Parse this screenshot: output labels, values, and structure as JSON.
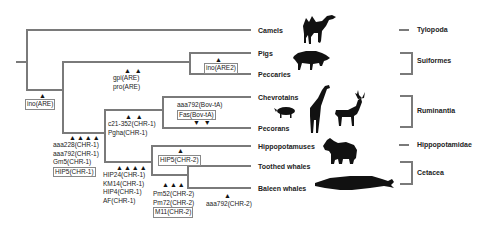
{
  "taxa": [
    {
      "name": "Camels",
      "y": 30
    },
    {
      "name": "Pigs",
      "y": 53
    },
    {
      "name": "Peccaries",
      "y": 74
    },
    {
      "name": "Chevrotains",
      "y": 97
    },
    {
      "name": "Pecorans",
      "y": 128
    },
    {
      "name": "Hippopotamuses",
      "y": 146
    },
    {
      "name": "Toothed whales",
      "y": 166
    },
    {
      "name": "Baleen whales",
      "y": 188
    }
  ],
  "groups": [
    {
      "name": "Tylopoda"
    },
    {
      "name": "Suiformes"
    },
    {
      "name": "Ruminantia"
    },
    {
      "name": "Hippopotamidae"
    },
    {
      "name": "Cetacea"
    }
  ],
  "sine_markers": {
    "ino_are": {
      "arrows": "▲",
      "lines": [
        "ino(ARE)"
      ],
      "boxed": [
        0
      ]
    },
    "ino_are2": {
      "arrows": "▲",
      "lines": [
        "ino(ARE2)"
      ],
      "boxed": [
        0
      ]
    },
    "gpi_pro": {
      "arrows": "▲ ▲",
      "lines": [
        "gpi(ARE)",
        "pro(ARE)"
      ],
      "boxed": [
        0,
        1
      ]
    },
    "chr1_base": {
      "arrows": "▲▲▲▲",
      "lines": [
        "aaa228(CHR-1)",
        "aaa792(CHR-1)",
        "Gm5(CHR-1)",
        "HIP5(CHR-1)"
      ],
      "boxed": [
        3
      ]
    },
    "c21_pgha": {
      "arrows": "▲ ▲",
      "lines": [
        "c21-352(CHR-1)",
        "Pgha(CHR-1)"
      ],
      "boxed": []
    },
    "bov_ta": {
      "arrows": "▼ ▼",
      "lines": [
        "aaa792(Bov-tA)",
        "Fas(Bov-tA)"
      ],
      "boxed": [
        1
      ]
    },
    "hip_km_af": {
      "arrows": "▲▲▲▲",
      "lines": [
        "HIP24(CHR-1)",
        "KM14(CHR-1)",
        "HIP4(CHR-1)",
        "AF(CHR-1)"
      ],
      "boxed": [
        0,
        1,
        2,
        3
      ]
    },
    "hip5_chr2": {
      "arrows": "▲",
      "lines": [
        "HIP5(CHR-2)"
      ],
      "boxed": [
        0
      ]
    },
    "pm_m11": {
      "arrows": "▲▲▲",
      "lines": [
        "Pm52(CHR-2)",
        "Pm72(CHR-2)",
        "M11(CHR-2)"
      ],
      "boxed": [
        2
      ]
    },
    "aaa792_chr2": {
      "arrows": "▲",
      "lines": [
        "aaa792(CHR-2)"
      ],
      "boxed": []
    }
  },
  "silhouettes": [
    "camel-icon",
    "pig-icon",
    "chevrotain-icon",
    "giraffe-icon",
    "deer-icon",
    "hippo-icon",
    "whale-icon"
  ],
  "colors": {
    "branch": "#7a7a7a",
    "silhouette": "#111111"
  }
}
